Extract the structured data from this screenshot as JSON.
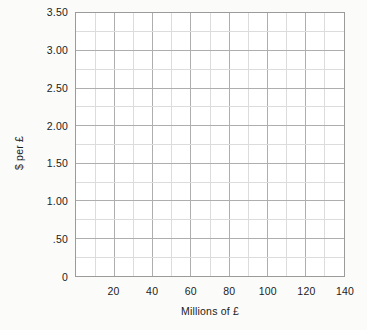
{
  "chart_data": {
    "type": "line",
    "title": "",
    "subtitle": "",
    "xlabel": "Millions of £",
    "ylabel": "$ per £",
    "xlim": [
      0,
      140
    ],
    "ylim": [
      0,
      3.5
    ],
    "xticks": [
      {
        "value": 20,
        "label": "20"
      },
      {
        "value": 40,
        "label": "40"
      },
      {
        "value": 60,
        "label": "60"
      },
      {
        "value": 80,
        "label": "80"
      },
      {
        "value": 100,
        "label": "100"
      },
      {
        "value": 120,
        "label": "120"
      },
      {
        "value": 140,
        "label": "140"
      }
    ],
    "yticks": [
      {
        "value": 0,
        "label": "0"
      },
      {
        "value": 0.5,
        "label": ".50"
      },
      {
        "value": 1.0,
        "label": "1.00"
      },
      {
        "value": 1.5,
        "label": "1.50"
      },
      {
        "value": 2.0,
        "label": "2.00"
      },
      {
        "value": 2.5,
        "label": "2.50"
      },
      {
        "value": 3.0,
        "label": "3.00"
      },
      {
        "value": 3.5,
        "label": "3.50"
      }
    ],
    "x_major_step": 20,
    "x_minor_step": 10,
    "y_major_step": 0.5,
    "y_minor_step": 0.25,
    "grid": true,
    "legend": null,
    "series": [],
    "annotations": [],
    "note": "Blank graph grid; no data series plotted."
  },
  "style": {
    "background_color": "#fbfbfa",
    "plot_background_color": "#ffffff",
    "border_color": "#9b9b9b",
    "major_gridline_color": "#adadad",
    "minor_gridline_color": "#dcdcdc",
    "text_color": "#1b1b1b"
  }
}
